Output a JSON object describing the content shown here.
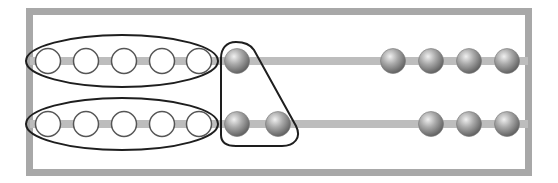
{
  "diagram": {
    "type": "rekenrek",
    "frame": {
      "x": 26,
      "y": 8,
      "width": 506,
      "height": 168,
      "thickness": 7,
      "color": "#a8a8a8"
    },
    "rods": [
      {
        "name": "top-rod",
        "y": 61
      },
      {
        "name": "bottom-rod",
        "y": 124
      }
    ],
    "rod_color": "#b8b8b8",
    "bead_radius": 12.5,
    "rows": [
      {
        "name": "row-1",
        "white_beads": [
          48,
          86,
          124,
          162,
          199
        ],
        "grouped_gray_beads": [
          237
        ],
        "right_gray_beads": [
          393,
          431,
          469,
          507
        ]
      },
      {
        "name": "row-2",
        "white_beads": [
          48,
          86,
          124,
          162,
          199
        ],
        "grouped_gray_beads": [
          237,
          278
        ],
        "right_gray_beads": [
          431,
          469,
          507
        ]
      }
    ],
    "groupings": [
      {
        "name": "top-five-white-group",
        "shape": "ellipse",
        "cx": 122,
        "cy": 61,
        "rx": 97,
        "ry": 27
      },
      {
        "name": "bottom-five-white-group",
        "shape": "ellipse",
        "cx": 122,
        "cy": 124,
        "rx": 97,
        "ry": 27
      },
      {
        "name": "gray-three-group",
        "shape": "triangle-outline"
      }
    ],
    "colors": {
      "white_bead_fill": "#ffffff",
      "white_bead_stroke": "#555555",
      "gray_bead_light": "#e0e0e0",
      "gray_bead_dark": "#6f6f6f",
      "group_outline": "#1e1e1e"
    }
  }
}
